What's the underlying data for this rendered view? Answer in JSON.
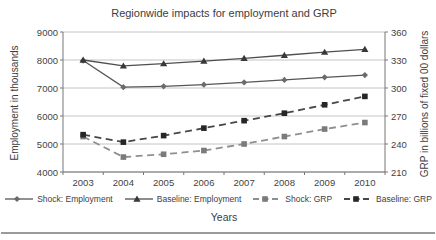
{
  "figure": {
    "title": "Regionwide impacts for employment and GRP",
    "x_axis_title": "Years",
    "left_axis_title": "Employment in thousands",
    "right_axis_title": "GRP in billions of fixed 00 dollars"
  },
  "chart_data": {
    "type": "line",
    "title": "Regionwide impacts for employment and GRP",
    "xlabel": "Years",
    "x": [
      2003,
      2004,
      2005,
      2006,
      2007,
      2008,
      2009,
      2010
    ],
    "left_axis": {
      "label": "Employment in thousands",
      "range": [
        4000,
        9000
      ],
      "ticks": [
        9000,
        8000,
        7000,
        6000,
        5000,
        4000
      ]
    },
    "right_axis": {
      "label": "GRP in billions of fixed 00 dollars",
      "range": [
        210,
        360
      ],
      "ticks": [
        360,
        330,
        300,
        270,
        240,
        210
      ]
    },
    "grid": "horizontal",
    "legend_position": "bottom",
    "colors": {
      "gridline": "#b5b5b5",
      "axis": "#777777",
      "text": "#3d3d3d"
    },
    "series": [
      {
        "name": "Shock: Employment",
        "axis": "left",
        "line_style": "solid",
        "marker": "diamond",
        "line_color": "#565656",
        "marker_color": "#6b6b6b",
        "values": [
          7980,
          7030,
          7060,
          7120,
          7200,
          7290,
          7380,
          7460
        ]
      },
      {
        "name": "Baseline: Employment",
        "axis": "left",
        "line_style": "solid",
        "marker": "triangle",
        "line_color": "#4f4f4f",
        "marker_color": "#383838",
        "values": [
          8000,
          7790,
          7870,
          7960,
          8060,
          8170,
          8280,
          8380
        ]
      },
      {
        "name": "Shock: GRP",
        "axis": "right",
        "line_style": "dashed",
        "marker": "square",
        "line_color": "#8f8f8f",
        "marker_color": "#7b7b7b",
        "values": [
          248,
          226,
          229,
          233,
          240,
          248,
          256,
          263
        ]
      },
      {
        "name": "Baseline: GRP",
        "axis": "right",
        "line_style": "dashed",
        "marker": "square",
        "line_color": "#474747",
        "marker_color": "#262626",
        "values": [
          250,
          242,
          249,
          257,
          265,
          273,
          282,
          291
        ]
      }
    ]
  }
}
